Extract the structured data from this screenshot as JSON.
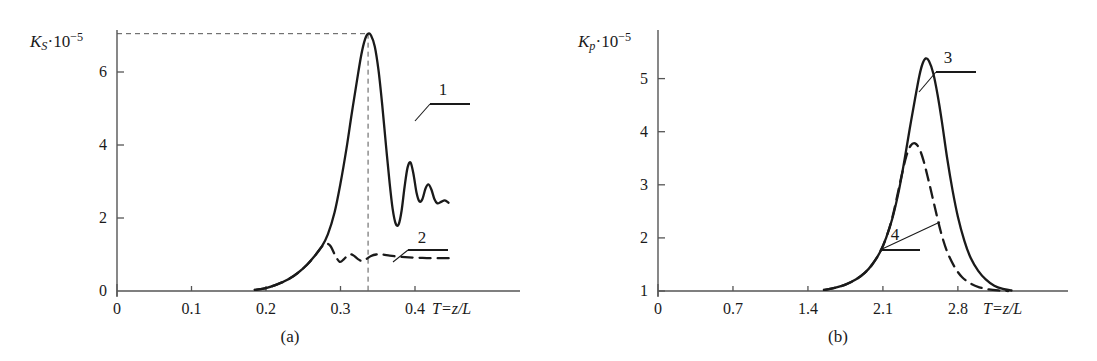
{
  "figure": {
    "panels": [
      {
        "id": "a",
        "caption": "(a)",
        "y_axis": {
          "symbol": "K",
          "subscript": "S",
          "multiplier": "·10",
          "exponent": "−5"
        },
        "x_axis": {
          "label": "T=z/L"
        },
        "x_ticks": [
          "0",
          "0.1",
          "0.2",
          "0.3",
          "0.4"
        ],
        "y_ticks": [
          "0",
          "2",
          "4",
          "6"
        ],
        "curve_labels": [
          "1",
          "2"
        ]
      },
      {
        "id": "b",
        "caption": "(b)",
        "y_axis": {
          "symbol": "K",
          "subscript": "p",
          "multiplier": "·10",
          "exponent": "−5"
        },
        "x_axis": {
          "label": "T=z/L"
        },
        "x_ticks": [
          "0",
          "0.7",
          "1.4",
          "2.1",
          "2.8"
        ],
        "y_ticks": [
          "1",
          "2",
          "3",
          "4",
          "5"
        ],
        "curve_labels": [
          "3",
          "4"
        ]
      }
    ]
  },
  "colors": {
    "ink": "#1a1a1a",
    "axis": "#555555",
    "curve": "#1a1a1a",
    "guide": "#555555",
    "background": "#ffffff"
  },
  "chart_data": [
    {
      "type": "line",
      "panel": "a",
      "title": "",
      "xlabel": "T=z/L",
      "ylabel": "K_S·10^-5",
      "xlim": [
        0,
        0.46
      ],
      "ylim": [
        0,
        7.6
      ],
      "xticks": [
        0,
        0.1,
        0.2,
        0.3,
        0.4
      ],
      "yticks": [
        0,
        2,
        4,
        6
      ],
      "grid": false,
      "legend": "curve-number-callouts",
      "annotations": [
        {
          "text": "1",
          "target_series": "1",
          "x": 0.355,
          "y": 5.1
        },
        {
          "text": "2",
          "target_series": "2",
          "x": 0.352,
          "y": 1.55
        },
        {
          "text": "guide-to-peak",
          "style": "dashed",
          "x": 0.337,
          "y": 7.05
        }
      ],
      "series": [
        {
          "name": "1",
          "style": "solid",
          "x": [
            0.185,
            0.2,
            0.215,
            0.23,
            0.243,
            0.255,
            0.265,
            0.275,
            0.283,
            0.292,
            0.3,
            0.308,
            0.315,
            0.322,
            0.328,
            0.333,
            0.337,
            0.341,
            0.346,
            0.351,
            0.356,
            0.361,
            0.366,
            0.37,
            0.374,
            0.378,
            0.382,
            0.386,
            0.39,
            0.394,
            0.398,
            0.402,
            0.406,
            0.41,
            0.414,
            0.418,
            0.422,
            0.426,
            0.43,
            0.435,
            0.44,
            0.445
          ],
          "y": [
            0.03,
            0.08,
            0.18,
            0.32,
            0.5,
            0.72,
            0.95,
            1.22,
            1.55,
            2.15,
            2.95,
            3.9,
            4.85,
            5.75,
            6.48,
            6.9,
            7.05,
            7.0,
            6.7,
            6.05,
            5.1,
            4.0,
            2.95,
            2.25,
            1.85,
            1.82,
            2.2,
            2.85,
            3.38,
            3.52,
            3.2,
            2.7,
            2.45,
            2.52,
            2.8,
            2.92,
            2.78,
            2.52,
            2.4,
            2.44,
            2.48,
            2.42
          ]
        },
        {
          "name": "2",
          "style": "dashed",
          "x": [
            0.185,
            0.2,
            0.215,
            0.23,
            0.243,
            0.255,
            0.265,
            0.275,
            0.281,
            0.287,
            0.293,
            0.299,
            0.305,
            0.311,
            0.317,
            0.323,
            0.329,
            0.335,
            0.341,
            0.348,
            0.356,
            0.366,
            0.378,
            0.392,
            0.406,
            0.42,
            0.434,
            0.446
          ],
          "y": [
            0.03,
            0.08,
            0.18,
            0.32,
            0.5,
            0.72,
            0.95,
            1.22,
            1.3,
            1.22,
            0.97,
            0.8,
            0.88,
            1.0,
            0.98,
            0.88,
            0.82,
            0.88,
            0.96,
            1.0,
            1.0,
            0.97,
            0.94,
            0.92,
            0.91,
            0.9,
            0.9,
            0.9
          ]
        }
      ]
    },
    {
      "type": "line",
      "panel": "b",
      "title": "",
      "xlabel": "T=z/L",
      "ylabel": "K_p·10^-5",
      "xlim": [
        0,
        3.3
      ],
      "ylim": [
        1,
        5.9
      ],
      "xticks": [
        0,
        0.7,
        1.4,
        2.1,
        2.8
      ],
      "yticks": [
        1,
        2,
        3,
        4,
        5
      ],
      "grid": false,
      "legend": "curve-number-callouts",
      "annotations": [
        {
          "text": "3",
          "target_series": "3",
          "x": 2.63,
          "y": 5.35
        },
        {
          "text": "4",
          "target_series": "4",
          "x": 2.33,
          "y": 1.75
        }
      ],
      "series": [
        {
          "name": "3",
          "style": "solid",
          "x": [
            1.55,
            1.65,
            1.75,
            1.85,
            1.93,
            2.0,
            2.07,
            2.13,
            2.19,
            2.25,
            2.3,
            2.35,
            2.4,
            2.44,
            2.47,
            2.5,
            2.53,
            2.57,
            2.61,
            2.65,
            2.7,
            2.75,
            2.8,
            2.86,
            2.92,
            2.99,
            3.06,
            3.14,
            3.22,
            3.3
          ],
          "y": [
            1.02,
            1.06,
            1.12,
            1.22,
            1.34,
            1.5,
            1.72,
            2.0,
            2.38,
            2.9,
            3.45,
            4.05,
            4.62,
            5.05,
            5.28,
            5.38,
            5.33,
            5.1,
            4.7,
            4.2,
            3.5,
            2.9,
            2.4,
            1.95,
            1.62,
            1.38,
            1.22,
            1.1,
            1.04,
            1.01
          ]
        },
        {
          "name": "4",
          "style": "dashed",
          "x": [
            1.55,
            1.65,
            1.75,
            1.85,
            1.93,
            2.0,
            2.07,
            2.13,
            2.19,
            2.24,
            2.28,
            2.32,
            2.36,
            2.4,
            2.44,
            2.48,
            2.53,
            2.58,
            2.64,
            2.7,
            2.77,
            2.84,
            2.92,
            3.0,
            3.09,
            3.18,
            3.27
          ],
          "y": [
            1.02,
            1.06,
            1.12,
            1.22,
            1.34,
            1.5,
            1.72,
            2.0,
            2.4,
            2.85,
            3.22,
            3.55,
            3.74,
            3.78,
            3.68,
            3.45,
            3.05,
            2.62,
            2.12,
            1.74,
            1.45,
            1.26,
            1.14,
            1.07,
            1.03,
            1.01,
            1.0
          ]
        }
      ]
    }
  ]
}
